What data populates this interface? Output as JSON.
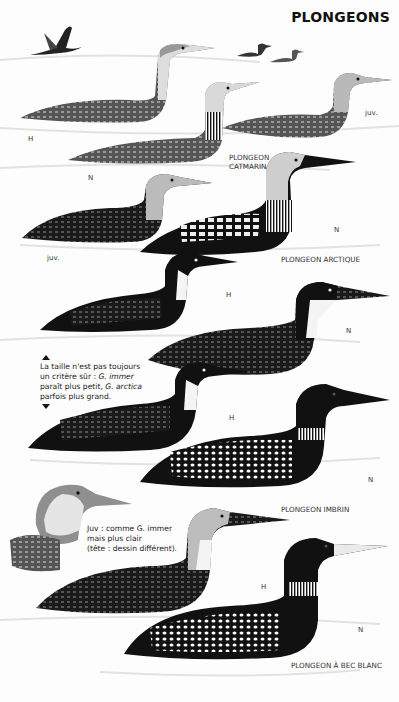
{
  "title": "PLONGEONS",
  "species": [
    {
      "name_line1": "PLONGEON",
      "name_line2": "CATMARIN"
    },
    {
      "name": "PLONGEON ARCTIQUE"
    },
    {
      "name": "PLONGEON IMBRIN"
    },
    {
      "name": "PLONGEON À BEC BLANC"
    }
  ],
  "plumage_labels": {
    "catmarin_h": "H",
    "catmarin_n": "N",
    "catmarin_juv": "juv.",
    "arctique_n": "N",
    "arctique_juv": "juv.",
    "imbrin_h": "H",
    "imbrin_n1": "N",
    "imbrin_h2": "H",
    "imbrin_n2": "N",
    "blanc_h": "H",
    "blanc_n": "N"
  },
  "notes": {
    "size_note": {
      "line1": "La taille n'est pas toujours",
      "line2_prefix": "un critère sûr : ",
      "line2_italic": "G. immer",
      "line3_prefix": "paraît plus petit, ",
      "line3_italic": "G. arctica",
      "line4": "parfois plus grand."
    },
    "juv_note": {
      "line1": "Juv : comme G. immer",
      "line2": "mais plus clair",
      "line3": "(tête : dessin différent)."
    }
  },
  "colors": {
    "background": "#fdfdfd",
    "ink": "#111111",
    "grey_bird": "#8a8a8a",
    "water": "#e9e9e9"
  }
}
